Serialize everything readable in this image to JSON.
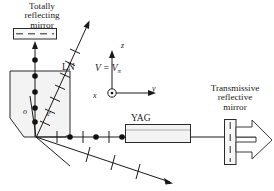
{
  "figure": {
    "type": "optics-schematic",
    "background": "#ffffff",
    "stroke": "#1a1a1a",
    "fill_light": "#f2f2f2",
    "width": 274,
    "height": 191
  },
  "labels": {
    "totally_reflecting_mirror": "Totally\nreflecting\nmirror",
    "transmissive_reflective_mirror": "Transmissive\nreflective\nmirror",
    "ln_crystal": "LN",
    "yag_crystal": "YAG",
    "voltage": "V = V",
    "voltage_subscript": "π",
    "axis_z": "z",
    "axis_y": "y",
    "axis_x": "x",
    "ray_ordinary": "o",
    "ray_extraordinary": "e"
  },
  "components": [
    {
      "name": "totally-reflecting-mirror",
      "shape": "rect-with-dashes",
      "x": 13,
      "y": 28,
      "w": 44,
      "h": 11
    },
    {
      "name": "ln-crystal",
      "shape": "pentagon",
      "x": 10,
      "y": 70,
      "w": 60,
      "h": 65
    },
    {
      "name": "yag-crystal",
      "shape": "rect",
      "x": 125,
      "y": 124,
      "w": 66,
      "h": 18
    },
    {
      "name": "transmissive-reflective-mirror",
      "shape": "vrect-with-dashes",
      "x": 224,
      "y": 119,
      "w": 12,
      "h": 46
    },
    {
      "name": "output-beam-arrow",
      "shape": "hollow-arrow",
      "x": 236,
      "y": 126,
      "w": 38,
      "h": 32
    },
    {
      "name": "coordinate-axes",
      "shape": "axes",
      "x": 98,
      "y": 50,
      "w": 60,
      "h": 40
    }
  ],
  "beams": {
    "vertical_cavity_marks": 5,
    "horizontal_cavity_marks": 7,
    "tilted_beam_ticks": 5,
    "output_diagonal_ticks": 3,
    "marker_dot_color": "#111111"
  }
}
